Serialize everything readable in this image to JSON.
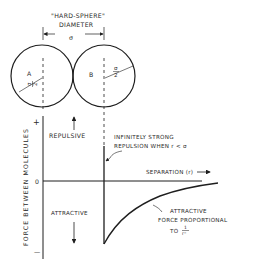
{
  "diagram": {
    "title_top": "\"HARD-SPHERE\"",
    "title_bottom": "DIAMETER",
    "sigma": "σ",
    "sigma_half_num": "σ",
    "sigma_half_den": "2",
    "molecule_a": "A",
    "molecule_b": "B",
    "repulsive": "REPULSIVE",
    "attractive": "ATTRACTIVE",
    "y_axis_label": "FORCE BETWEEN MOLECULES",
    "y_plus": "+",
    "y_zero": "0",
    "y_minus": "—",
    "x_axis_label": "SEPARATION (r)",
    "repulsion_note_line1": "INFINITELY STRONG",
    "repulsion_note_line2": "REPULSION WHEN  r < σ",
    "attraction_note_line1": "ATTRACTIVE",
    "attraction_note_line2": "FORCE  PROPORTIONAL",
    "attraction_note_line3": "TO",
    "attraction_frac_num": "1",
    "attraction_frac_den": "rⁿ"
  },
  "colors": {
    "ink": "#1e1e1e",
    "background": "#ffffff"
  }
}
